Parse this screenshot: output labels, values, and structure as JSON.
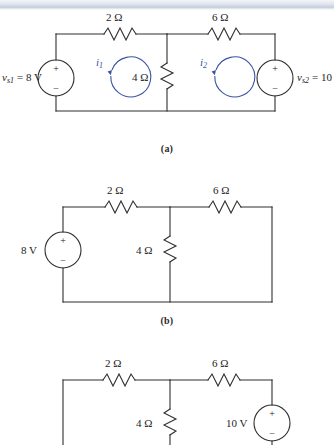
{
  "page": {
    "background": "#ffffff",
    "wire_color": "#2e2e2e",
    "loop_color": "#3b52a4",
    "width": 334,
    "height": 445
  },
  "figures": [
    {
      "id": "circuit-a",
      "caption": "(a)",
      "components": {
        "r_top_left": "2 Ω",
        "r_top_right": "6 Ω",
        "r_middle": "4 Ω",
        "source_left": "v",
        "source_left_sub": "s1",
        "source_left_value": "= 8 V",
        "source_left_full": "v_s1 = 8 V",
        "source_right": "v",
        "source_right_sub": "s2",
        "source_right_value": "= 10",
        "source_right_full": "v_s2 = 10",
        "plus": "+",
        "minus": "−"
      },
      "mesh_currents": [
        {
          "name": "i",
          "sub": "1",
          "direction": "counterclockwise"
        },
        {
          "name": "i",
          "sub": "2",
          "direction": "counterclockwise"
        }
      ]
    },
    {
      "id": "circuit-b",
      "caption": "(b)",
      "components": {
        "r_top_left": "2 Ω",
        "r_top_right": "6 Ω",
        "r_middle": "4 Ω",
        "source_left_value": "8 V",
        "plus": "+",
        "minus": "−",
        "right_branch": "short-circuit-wire"
      }
    },
    {
      "id": "circuit-c",
      "caption": "",
      "components": {
        "r_top_left": "2 Ω",
        "r_top_right": "6 Ω",
        "r_middle": "4 Ω",
        "source_right_value": "10 V",
        "plus": "+",
        "minus": "−",
        "left_branch": "short-circuit-wire"
      }
    }
  ]
}
